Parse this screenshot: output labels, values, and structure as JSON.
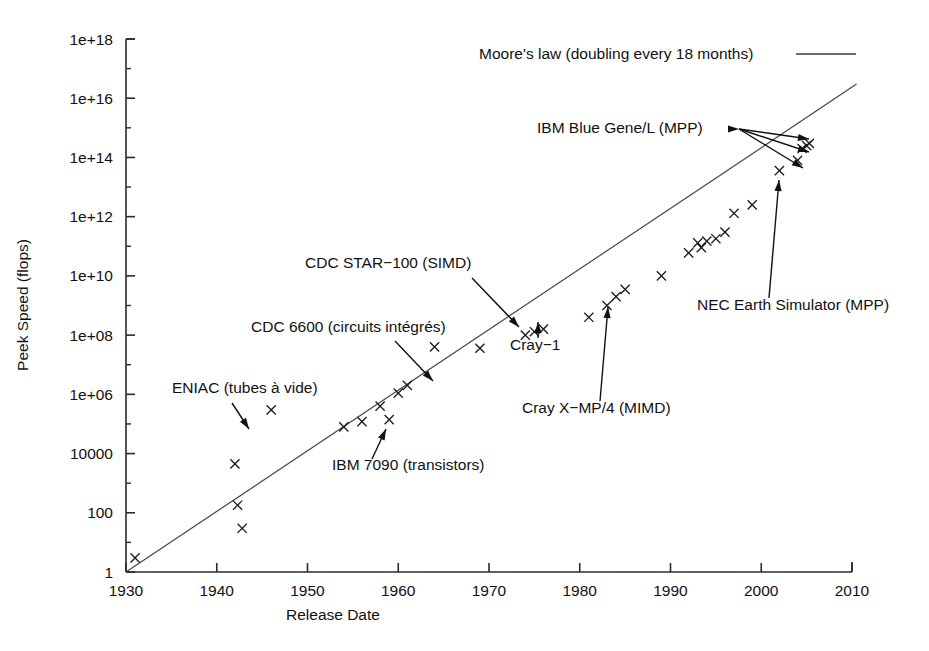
{
  "chart_data": {
    "type": "scatter",
    "title": "",
    "xlabel": "Release Date",
    "ylabel": "Peek Speed (flops)",
    "xlim": [
      1930,
      2010
    ],
    "ylim": [
      1,
      1e+18
    ],
    "yscale": "log",
    "grid": false,
    "legend_position": "top-right",
    "x_ticks": [
      "1930",
      "1940",
      "1950",
      "1960",
      "1970",
      "1980",
      "1990",
      "2000",
      "2010"
    ],
    "y_ticks": [
      "1",
      "100",
      "10000",
      "1e+06",
      "1e+08",
      "1e+10",
      "1e+12",
      "1e+14",
      "1e+16",
      "1e+18"
    ],
    "series": [
      {
        "name": "Supercomputer peak speed",
        "marker": "x",
        "points": [
          {
            "x": 1931,
            "y": 3
          },
          {
            "x": 1942,
            "y": 4500
          },
          {
            "x": 1942.3,
            "y": 180
          },
          {
            "x": 1942.8,
            "y": 30
          },
          {
            "x": 1946,
            "y": 300000
          },
          {
            "x": 1954,
            "y": 80000
          },
          {
            "x": 1956,
            "y": 120000
          },
          {
            "x": 1958,
            "y": 400000
          },
          {
            "x": 1959,
            "y": 140000
          },
          {
            "x": 1960,
            "y": 1100000
          },
          {
            "x": 1961,
            "y": 2000000
          },
          {
            "x": 1964,
            "y": 40000000
          },
          {
            "x": 1969,
            "y": 36000000
          },
          {
            "x": 1974,
            "y": 100000000
          },
          {
            "x": 1975,
            "y": 130000000
          },
          {
            "x": 1976,
            "y": 160000000
          },
          {
            "x": 1981,
            "y": 400000000
          },
          {
            "x": 1983,
            "y": 1000000000
          },
          {
            "x": 1984,
            "y": 2000000000
          },
          {
            "x": 1985,
            "y": 3500000000
          },
          {
            "x": 1989,
            "y": 10000000000
          },
          {
            "x": 1992,
            "y": 60000000000
          },
          {
            "x": 1993,
            "y": 130000000000
          },
          {
            "x": 1993.4,
            "y": 90000000000
          },
          {
            "x": 1994,
            "y": 150000000000
          },
          {
            "x": 1995,
            "y": 180000000000
          },
          {
            "x": 1996,
            "y": 300000000000
          },
          {
            "x": 1997,
            "y": 1300000000000
          },
          {
            "x": 1999,
            "y": 2500000000000
          },
          {
            "x": 2002,
            "y": 36000000000000
          },
          {
            "x": 2004,
            "y": 80000000000000
          },
          {
            "x": 2004.5,
            "y": 200000000000000
          },
          {
            "x": 2005,
            "y": 250000000000000
          },
          {
            "x": 2005.3,
            "y": 300000000000000
          }
        ]
      }
    ],
    "trend": {
      "name": "Moore's law (doubling every 18 months)",
      "start": {
        "x": 1930,
        "y": 1
      },
      "end": {
        "x": 2010.5,
        "y": 3e+16
      }
    },
    "annotations": [
      {
        "id": "eniac",
        "label": "ENIAC (tubes à vide)",
        "label_x": 172,
        "label_y": 393,
        "leader_from": [
          232,
          403
        ],
        "leader_to": [
          249,
          429
        ]
      },
      {
        "id": "ibm-7090",
        "label": "IBM 7090 (transistors)",
        "label_x": 332,
        "label_y": 470,
        "leader_from": [
          372,
          459
        ],
        "leader_to": [
          386,
          429
        ]
      },
      {
        "id": "cdc-6600",
        "label": "CDC 6600 (circuits intégrés)",
        "label_x": 251,
        "label_y": 332,
        "leader_from": [
          395,
          341
        ],
        "leader_to": [
          433,
          381
        ]
      },
      {
        "id": "cdc-star-100",
        "label": "CDC STAR−100 (SIMD)",
        "label_x": 305,
        "label_y": 268,
        "leader_from": [
          472,
          278
        ],
        "leader_to": [
          519,
          327
        ]
      },
      {
        "id": "cray-1",
        "label": "Cray−1",
        "label_x": 510,
        "label_y": 350,
        "leader_from": [
          538,
          338
        ],
        "leader_to": [
          538,
          322
        ]
      },
      {
        "id": "cray-xmp4",
        "label": "Cray X−MP/4 (MIMD)",
        "label_x": 522,
        "label_y": 413,
        "leader_from": [
          600,
          401
        ],
        "leader_to": [
          608,
          307
        ]
      },
      {
        "id": "nec-earth-simulator",
        "label": "NEC Earth Simulator (MPP)",
        "label_x": 697,
        "label_y": 310,
        "leader_from": [
          769,
          298
        ],
        "leader_to": [
          779,
          180
        ]
      },
      {
        "id": "ibm-blue-gene-l",
        "label": "IBM Blue Gene/L (MPP)",
        "label_x": 537,
        "label_y": 133,
        "leader_targets": [
          [
            739,
            129
          ],
          [
            809,
            139
          ],
          [
            809,
            152
          ]
        ],
        "leader_targets_extra": [
          [
            803,
            168
          ]
        ]
      }
    ],
    "legend": {
      "label": "Moore's law (doubling every 18 months)",
      "label_x": 479,
      "label_y": 59,
      "line_x1": 796,
      "line_x2": 856,
      "line_y": 54
    }
  },
  "axes": {
    "x_title": "Release Date",
    "y_title": "Peek Speed (flops)"
  }
}
